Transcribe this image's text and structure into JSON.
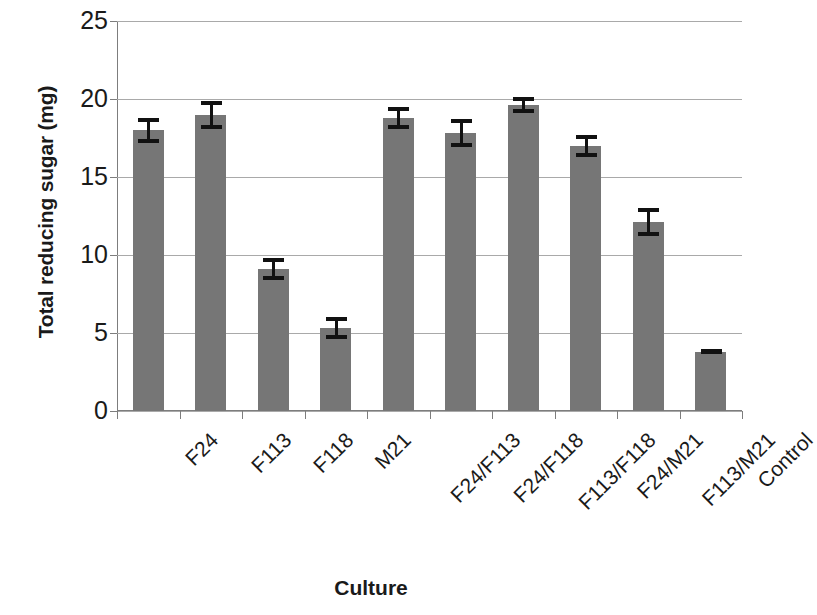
{
  "chart_data": {
    "type": "bar",
    "title": "",
    "xlabel": "Culture",
    "ylabel": "Total reducing sugar (mg)",
    "categories": [
      "F24",
      "F113",
      "F118",
      "M21",
      "F24/F113",
      "F24/F118",
      "F113/F118",
      "F24/M21",
      "F113/M21",
      "Control"
    ],
    "values": [
      18.0,
      19.0,
      9.1,
      5.3,
      18.8,
      17.8,
      19.6,
      17.0,
      12.1,
      3.8
    ],
    "errors": [
      0.8,
      0.9,
      0.7,
      0.7,
      0.7,
      0.9,
      0.5,
      0.7,
      0.9,
      0.1
    ],
    "ylim": [
      0,
      25
    ],
    "yticks": [
      0,
      5,
      10,
      15,
      20,
      25
    ],
    "ytick_labels": [
      "0",
      "5",
      "10",
      "15",
      "20",
      "25"
    ],
    "grid": true,
    "legend": false,
    "bar_color": "#767676",
    "error_color": "#111111",
    "grid_color": "#a9a9a9",
    "axis_color": "#7d7d7d"
  }
}
